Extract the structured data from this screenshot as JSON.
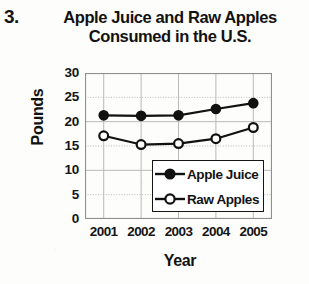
{
  "question_number": "3.",
  "chart_data": {
    "type": "line",
    "title": "Apple Juice and Raw Apples Consumed in the U.S.",
    "title_line1": "Apple Juice and Raw Apples",
    "title_line2": "Consumed in the U.S.",
    "xlabel": "Year",
    "ylabel": "Pounds",
    "categories": [
      "2001",
      "2002",
      "2003",
      "2004",
      "2005"
    ],
    "x": [
      2001,
      2002,
      2003,
      2004,
      2005
    ],
    "series": [
      {
        "name": "Apple Juice",
        "marker": "filled-circle",
        "values": [
          21.3,
          21.2,
          21.3,
          22.6,
          23.8
        ]
      },
      {
        "name": "Raw Apples",
        "marker": "open-circle",
        "values": [
          17.1,
          15.3,
          15.5,
          16.5,
          18.8
        ]
      }
    ],
    "ylim": [
      0,
      30
    ],
    "yticks": [
      0,
      5,
      10,
      15,
      20,
      25,
      30
    ],
    "ytick_labels": [
      "0",
      "5",
      "10",
      "15",
      "20",
      "25",
      "30"
    ],
    "grid": true,
    "legend_position": "bottom-right-inside",
    "line_color": "#111111",
    "grid_color": "#b9b9b9",
    "frame_color": "#8f8f8f"
  }
}
